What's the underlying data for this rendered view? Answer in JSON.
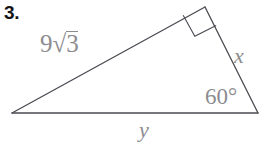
{
  "problem": {
    "number": "3."
  },
  "figure": {
    "type": "right-triangle",
    "background_color": "#ffffff",
    "stroke_color": "#4a4a52",
    "label_color": "#8c8c8f",
    "number_color": "#141414",
    "vertices": {
      "left": {
        "x": 12,
        "y": 113
      },
      "apex": {
        "x": 205,
        "y": 7
      },
      "right": {
        "x": 258,
        "y": 113
      }
    },
    "right_angle_marker": {
      "at_vertex": "apex",
      "size": 26
    }
  },
  "labels": {
    "hypotenuse": {
      "coefficient": "9",
      "radical_sign": "√",
      "radicand": "3",
      "full_text": "9√3"
    },
    "side_x": "x",
    "side_y": "y",
    "angle": "60°"
  }
}
